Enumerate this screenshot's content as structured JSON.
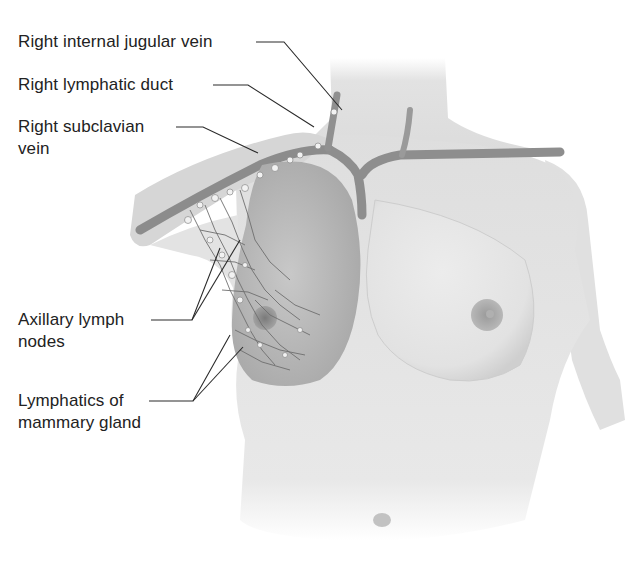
{
  "figure": {
    "labels": {
      "jugular": "Right internal jugular vein",
      "lymph_duct": "Right lymphatic duct",
      "subclavian_l1": "Right subclavian",
      "subclavian_l2": "vein",
      "axillary_l1": "Axillary lymph",
      "axillary_l2": "nodes",
      "mammary_l1": "Lymphatics of",
      "mammary_l2": "mammary gland"
    },
    "colors": {
      "skin": "#e6e6e6",
      "skin_shadow": "#c4c4c4",
      "vein": "#8a8a8a",
      "lymph_node": "#f2f2f2",
      "leader_line": "#2a2a2a",
      "text": "#222222"
    }
  }
}
